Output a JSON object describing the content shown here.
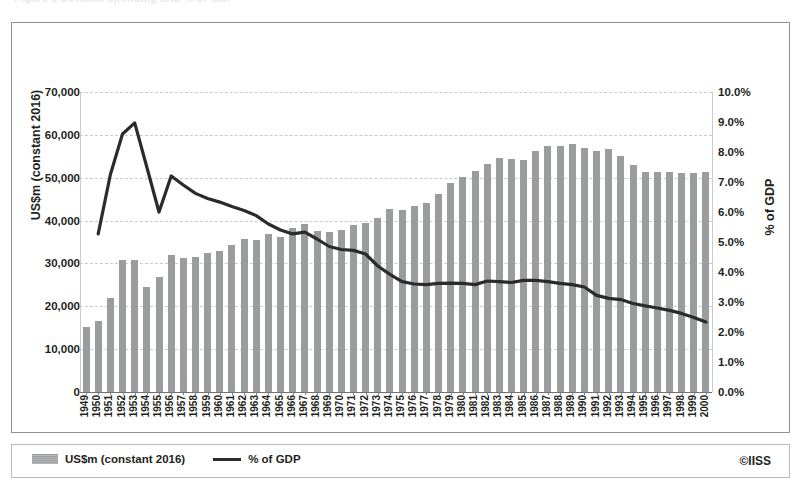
{
  "figure": {
    "clipped_caption": "Figure 1  Defence spending and % of GDP",
    "copyright": "©IISS"
  },
  "legend": {
    "items": [
      {
        "label": "US$m (constant 2016)",
        "marker": "bar-swatch",
        "color": "#9a9c9e"
      },
      {
        "label": "% of GDP",
        "marker": "line-swatch",
        "color": "#2b2b2b"
      }
    ]
  },
  "axes": {
    "left_title": "US$m (constant 2016)",
    "right_title": "% of GDP",
    "left_ticks": [
      "0",
      "10,000",
      "20,000",
      "30,000",
      "40,000",
      "50,000",
      "60,000",
      "70,000"
    ],
    "right_ticks": [
      "0.0%",
      "1.0%",
      "2.0%",
      "3.0%",
      "4.0%",
      "5.0%",
      "6.0%",
      "7.0%",
      "8.0%",
      "9.0%",
      "10.0%"
    ]
  },
  "chart_data": {
    "type": "bar",
    "title": "",
    "xlabel": "",
    "ylabel": "US$m (constant 2016)",
    "y2label": "% of GDP",
    "ylim": [
      0,
      70000
    ],
    "y2lim": [
      0,
      10
    ],
    "grid": true,
    "legend_position": "bottom-left",
    "categories": [
      "1949",
      "1950",
      "1951",
      "1952",
      "1953",
      "1954",
      "1955",
      "1956",
      "1957",
      "1958",
      "1959",
      "1960",
      "1961",
      "1962",
      "1963",
      "1964",
      "1965",
      "1966",
      "1967",
      "1968",
      "1969",
      "1970",
      "1971",
      "1972",
      "1973",
      "1974",
      "1975",
      "1976",
      "1977",
      "1978",
      "1979",
      "1980",
      "1981",
      "1982",
      "1983",
      "1984",
      "1985",
      "1986",
      "1987",
      "1988",
      "1989",
      "1990",
      "1991",
      "1992",
      "1993",
      "1994",
      "1995",
      "1996",
      "1997",
      "1998",
      "1999",
      "2000"
    ],
    "series": [
      {
        "name": "US$m (constant 2016)",
        "type": "bar",
        "axis": "left",
        "color": "#9a9c9e",
        "values": [
          15200,
          16500,
          22000,
          30900,
          30800,
          24600,
          26800,
          31900,
          31300,
          31400,
          32400,
          33000,
          34400,
          35800,
          35500,
          36800,
          36200,
          38200,
          39300,
          37500,
          37400,
          37700,
          38900,
          39400,
          40700,
          42700,
          42400,
          43300,
          44200,
          46200,
          48800,
          50200,
          51600,
          53300,
          54500,
          54300,
          54200,
          56200,
          57400,
          57400,
          57800,
          56900,
          56300,
          56800,
          55000,
          52900,
          51400,
          51400,
          51400,
          51200,
          51200,
          51400
        ]
      },
      {
        "name": "% of GDP",
        "type": "line",
        "axis": "right",
        "color": "#2b2b2b",
        "values": [
          null,
          5.27,
          7.25,
          8.6,
          8.97,
          7.5,
          6.0,
          7.2,
          6.9,
          6.62,
          6.45,
          6.33,
          6.18,
          6.05,
          5.88,
          5.6,
          5.4,
          5.27,
          5.33,
          5.1,
          4.85,
          4.75,
          4.72,
          4.6,
          4.2,
          3.92,
          3.68,
          3.6,
          3.58,
          3.62,
          3.63,
          3.62,
          3.58,
          3.7,
          3.68,
          3.65,
          3.72,
          3.72,
          3.68,
          3.62,
          3.58,
          3.5,
          3.22,
          3.12,
          3.08,
          2.95,
          2.87,
          2.8,
          2.72,
          2.62,
          2.48,
          2.33
        ]
      }
    ]
  }
}
